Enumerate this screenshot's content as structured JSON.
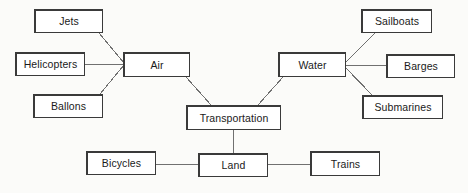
{
  "diagram": {
    "type": "concept-map",
    "background_color": "#fbfbf9",
    "box_fill_color": "#ffffff",
    "box_border_color": "#3a3a3a",
    "edge_color": "#707070",
    "nodes": [
      {
        "id": "jets",
        "label": "Jets",
        "x": 34,
        "y": 9,
        "w": 69,
        "h": 24,
        "level": "leaf"
      },
      {
        "id": "helicopters",
        "label": "Helicopters",
        "x": 15,
        "y": 52,
        "w": 70,
        "h": 24,
        "level": "leaf"
      },
      {
        "id": "ballons",
        "label": "Ballons",
        "x": 33,
        "y": 94,
        "w": 70,
        "h": 24,
        "level": "leaf"
      },
      {
        "id": "air",
        "label": "Air",
        "x": 123,
        "y": 52,
        "w": 67,
        "h": 25,
        "level": "branch"
      },
      {
        "id": "transportation",
        "label": "Transportation",
        "x": 186,
        "y": 105,
        "w": 95,
        "h": 25,
        "level": "root"
      },
      {
        "id": "water",
        "label": "Water",
        "x": 278,
        "y": 52,
        "w": 68,
        "h": 25,
        "level": "branch"
      },
      {
        "id": "sailboats",
        "label": "Sailboats",
        "x": 361,
        "y": 9,
        "w": 71,
        "h": 24,
        "level": "leaf"
      },
      {
        "id": "barges",
        "label": "Barges",
        "x": 386,
        "y": 54,
        "w": 69,
        "h": 24,
        "level": "leaf"
      },
      {
        "id": "submarines",
        "label": "Submarines",
        "x": 362,
        "y": 95,
        "w": 81,
        "h": 24,
        "level": "leaf"
      },
      {
        "id": "bicycles",
        "label": "Bicycles",
        "x": 86,
        "y": 151,
        "w": 70,
        "h": 24,
        "level": "leaf"
      },
      {
        "id": "land",
        "label": "Land",
        "x": 198,
        "y": 153,
        "w": 70,
        "h": 24,
        "level": "branch"
      },
      {
        "id": "trains",
        "label": "Trains",
        "x": 310,
        "y": 151,
        "w": 70,
        "h": 25,
        "level": "leaf"
      }
    ],
    "edges": [
      {
        "id": "jets-air",
        "from": "jets",
        "to": "air",
        "x1": 99,
        "y1": 33,
        "x2": 124,
        "y2": 63
      },
      {
        "id": "helicopters-air",
        "from": "helicopters",
        "to": "air",
        "x1": 85,
        "y1": 64,
        "x2": 124,
        "y2": 64
      },
      {
        "id": "ballons-air",
        "from": "ballons",
        "to": "air",
        "x1": 100,
        "y1": 94,
        "x2": 124,
        "y2": 65
      },
      {
        "id": "air-transportation",
        "from": "air",
        "to": "transportation",
        "x1": 186,
        "y1": 77,
        "x2": 211,
        "y2": 105
      },
      {
        "id": "water-transportation",
        "from": "water",
        "to": "transportation",
        "x1": 283,
        "y1": 77,
        "x2": 258,
        "y2": 105
      },
      {
        "id": "water-sailboats",
        "from": "water",
        "to": "sailboats",
        "x1": 345,
        "y1": 63,
        "x2": 375,
        "y2": 33
      },
      {
        "id": "water-barges",
        "from": "water",
        "to": "barges",
        "x1": 345,
        "y1": 65,
        "x2": 386,
        "y2": 65
      },
      {
        "id": "water-submarines",
        "from": "water",
        "to": "submarines",
        "x1": 345,
        "y1": 67,
        "x2": 372,
        "y2": 95
      },
      {
        "id": "transportation-land",
        "from": "transportation",
        "to": "land",
        "x1": 233,
        "y1": 130,
        "x2": 233,
        "y2": 153
      },
      {
        "id": "bicycles-land",
        "from": "bicycles",
        "to": "land",
        "x1": 156,
        "y1": 164,
        "x2": 198,
        "y2": 164
      },
      {
        "id": "land-trains",
        "from": "land",
        "to": "trains",
        "x1": 268,
        "y1": 164,
        "x2": 310,
        "y2": 164
      }
    ]
  }
}
